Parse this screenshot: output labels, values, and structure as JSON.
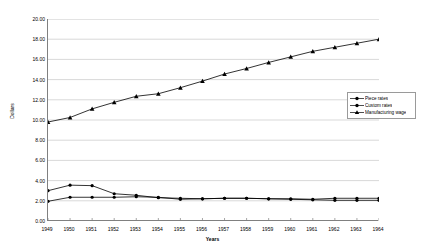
{
  "chart_data": {
    "type": "line",
    "title": "",
    "xlabel": "Years",
    "ylabel": "Dollars",
    "xlim": [
      1949,
      1964
    ],
    "ylim": [
      0,
      20
    ],
    "ytick_step": 2,
    "grid": true,
    "legend_position": "right",
    "x": [
      1949,
      1950,
      1951,
      1952,
      1953,
      1954,
      1955,
      1956,
      1957,
      1958,
      1959,
      1960,
      1961,
      1962,
      1963,
      1964
    ],
    "categories": [
      "1949",
      "1950",
      "1951",
      "1952",
      "1953",
      "1954",
      "1955",
      "1956",
      "1957",
      "1958",
      "1959",
      "1960",
      "1961",
      "1962",
      "1963",
      "1964"
    ],
    "ytick_labels": [
      "0.00",
      "2.00",
      "4.00",
      "6.00",
      "8.00",
      "10.00",
      "12.00",
      "14.00",
      "16.00",
      "18.00",
      "20.00"
    ],
    "ytick_values": [
      0,
      2,
      4,
      6,
      8,
      10,
      12,
      14,
      16,
      18,
      20
    ],
    "series": [
      {
        "name": "Piece rates",
        "marker": "circle",
        "color": "#000000",
        "values": [
          3.0,
          3.55,
          3.5,
          2.7,
          2.55,
          2.3,
          2.25,
          2.2,
          2.25,
          2.25,
          2.2,
          2.15,
          2.1,
          2.05,
          2.05,
          2.05
        ]
      },
      {
        "name": "Custom rates",
        "marker": "circle",
        "color": "#000000",
        "values": [
          1.95,
          2.35,
          2.35,
          2.35,
          2.4,
          2.35,
          2.15,
          2.2,
          2.25,
          2.25,
          2.2,
          2.2,
          2.15,
          2.25,
          2.25,
          2.25
        ]
      },
      {
        "name": "Manufacturing wage",
        "marker": "triangle",
        "color": "#000000",
        "values": [
          9.8,
          10.25,
          11.1,
          11.75,
          12.35,
          12.6,
          13.2,
          13.85,
          14.55,
          15.1,
          15.7,
          16.25,
          16.8,
          17.2,
          17.6,
          18.0
        ]
      }
    ]
  },
  "axes": {
    "y_title": "Dollars",
    "x_title": "Years"
  },
  "legend": {
    "items": [
      {
        "label": "Piece rates",
        "marker": "circle"
      },
      {
        "label": "Custom rates",
        "marker": "circle"
      },
      {
        "label": "Manufacturing wage",
        "marker": "triangle"
      }
    ]
  },
  "colors": {
    "gridline": "#c8c8c8",
    "axis": "#808080",
    "series": "#000000",
    "legend_border": "#9a9a9a",
    "background": "#ffffff"
  }
}
